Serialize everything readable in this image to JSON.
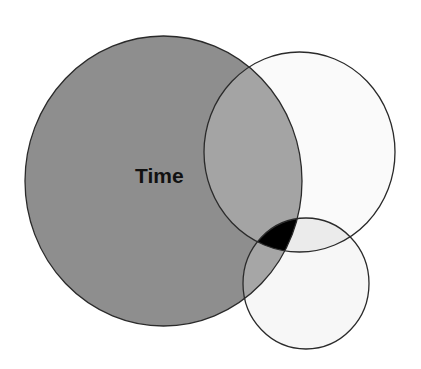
{
  "diagram": {
    "type": "venn",
    "background": "#ffffff",
    "stroke_color": "#2a2a2a",
    "circles": [
      {
        "id": "time",
        "label": "Time",
        "cx": 163.5,
        "cy": 181,
        "rx": 138.5,
        "ry": 145,
        "fill": "#8e8e8e"
      },
      {
        "id": "upper-right",
        "label": "",
        "cx": 299.5,
        "cy": 152,
        "rx": 95.5,
        "ry": 100,
        "fill": "#fafafa"
      },
      {
        "id": "lower-small",
        "label": "",
        "cx": 306,
        "cy": 283.5,
        "rx": 63,
        "ry": 65.5,
        "fill": "#f7f7f7"
      }
    ],
    "overlaps": {
      "time_upper_right": "#a4a4a4",
      "time_lower_small": "#a6a6a6",
      "upper_right_lower_small": "#ebebeb",
      "all_three": "#000000"
    },
    "labels": {
      "time": "Time"
    }
  }
}
